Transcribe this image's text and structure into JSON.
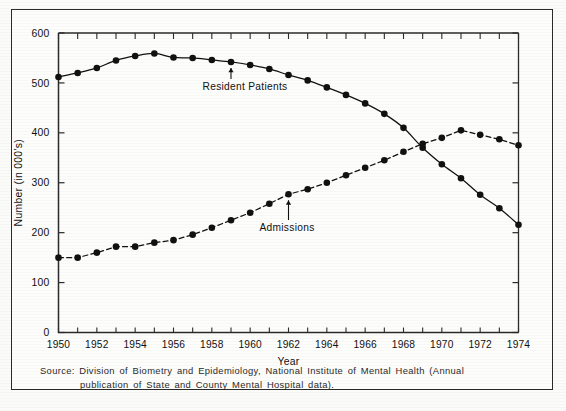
{
  "chart_data": {
    "type": "line",
    "title": "",
    "xlabel": "Year",
    "ylabel": "Number (in 000's)",
    "xlim": [
      1950,
      1974
    ],
    "ylim": [
      0,
      600
    ],
    "yticks": [
      0,
      100,
      200,
      300,
      400,
      500,
      600
    ],
    "ytick_labels": [
      "0",
      "100",
      "200",
      "300",
      "400",
      "500",
      "600"
    ],
    "xticks": [
      1950,
      1952,
      1954,
      1956,
      1958,
      1960,
      1962,
      1964,
      1966,
      1968,
      1970,
      1972,
      1974
    ],
    "xtick_labels": [
      "1950",
      "1952",
      "1954",
      "1956",
      "1958",
      "1960",
      "1962",
      "1964",
      "1966",
      "1968",
      "1970",
      "1972",
      "1974"
    ],
    "x_minor_tick_interval": 1,
    "grid": false,
    "legend_position": "inline-annotation",
    "x": [
      1950,
      1951,
      1952,
      1953,
      1954,
      1955,
      1956,
      1957,
      1958,
      1959,
      1960,
      1961,
      1962,
      1963,
      1964,
      1965,
      1966,
      1967,
      1968,
      1969,
      1970,
      1971,
      1972,
      1973,
      1974
    ],
    "series": [
      {
        "name": "Resident Patients",
        "line_style": "solid",
        "marker": "circle",
        "color": "#111111",
        "values": [
          512,
          520,
          530,
          545,
          554,
          559,
          551,
          550,
          546,
          542,
          536,
          528,
          516,
          505,
          491,
          476,
          459,
          438,
          410,
          370,
          337,
          309,
          276,
          249,
          216
        ]
      },
      {
        "name": "Admissions",
        "line_style": "dashed",
        "marker": "circle",
        "color": "#111111",
        "values": [
          150,
          150,
          160,
          172,
          172,
          180,
          185,
          196,
          210,
          225,
          240,
          258,
          277,
          287,
          300,
          315,
          330,
          345,
          362,
          378,
          390,
          405,
          396,
          387,
          375
        ]
      }
    ],
    "annotations": [
      {
        "text": "Resident Patients",
        "for_series": "Resident Patients",
        "points_to_year": 1959
      },
      {
        "text": "Admissions",
        "for_series": "Admissions",
        "points_to_year": 1962
      }
    ]
  },
  "caption": {
    "line1": "Source:  Division of Biometry and Epidemiology, National Institute of Mental Health (Annual",
    "line2": "publication of State and County Mental Hospital data)."
  },
  "colors": {
    "ink": "#111111",
    "axis": "#2b2b2b",
    "paper": "#fdfdfb"
  }
}
